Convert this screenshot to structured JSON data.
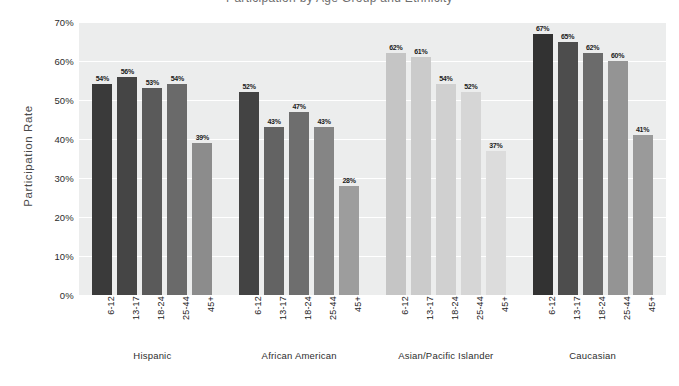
{
  "title_partial": "Participation by Age Group and Ethnicity",
  "axis": {
    "y_title": "Participation Rate",
    "y_ticks": [
      "70%",
      "60%",
      "50%",
      "40%",
      "30%",
      "20%",
      "10%",
      "0%"
    ]
  },
  "colors": {
    "plot_background": "#eceded",
    "gridline": "#ffffff",
    "text": "#232323"
  },
  "chart_data": {
    "type": "bar",
    "title": "Participation by Age Group and Ethnicity",
    "xlabel": "",
    "ylabel": "Participation Rate",
    "ylim": [
      0,
      70
    ],
    "ytick_labels": [
      "0%",
      "10%",
      "20%",
      "30%",
      "40%",
      "50%",
      "60%",
      "70%"
    ],
    "grid": true,
    "legend": "none",
    "categories": [
      "Hispanic",
      "African American",
      "Asian/Pacific Islander",
      "Caucasian"
    ],
    "age_groups": [
      "6-12",
      "13-17",
      "18-24",
      "25-44",
      "45+"
    ],
    "groups": [
      {
        "name": "Hispanic",
        "bars": [
          {
            "age": "6-12",
            "value": 54,
            "label": "54%",
            "color": "#3a3a3a"
          },
          {
            "age": "13-17",
            "value": 56,
            "label": "56%",
            "color": "#454545"
          },
          {
            "age": "18-24",
            "value": 53,
            "label": "53%",
            "color": "#5a5a5a"
          },
          {
            "age": "25-44",
            "value": 54,
            "label": "54%",
            "color": "#6a6a6a"
          },
          {
            "age": "45+",
            "value": 39,
            "label": "39%",
            "color": "#8c8c8c"
          }
        ]
      },
      {
        "name": "African American",
        "bars": [
          {
            "age": "6-12",
            "value": 52,
            "label": "52%",
            "color": "#434343"
          },
          {
            "age": "13-17",
            "value": 43,
            "label": "43%",
            "color": "#636363"
          },
          {
            "age": "18-24",
            "value": 47,
            "label": "47%",
            "color": "#6e6e6e"
          },
          {
            "age": "25-44",
            "value": 43,
            "label": "43%",
            "color": "#858585"
          },
          {
            "age": "45+",
            "value": 28,
            "label": "28%",
            "color": "#9d9d9d"
          }
        ]
      },
      {
        "name": "Asian/Pacific Islander",
        "bars": [
          {
            "age": "6-12",
            "value": 62,
            "label": "62%",
            "color": "#c5c5c5"
          },
          {
            "age": "13-17",
            "value": 61,
            "label": "61%",
            "color": "#cbcbcb"
          },
          {
            "age": "18-24",
            "value": 54,
            "label": "54%",
            "color": "#d0d0d0"
          },
          {
            "age": "25-44",
            "value": 52,
            "label": "52%",
            "color": "#d6d6d6"
          },
          {
            "age": "45+",
            "value": 37,
            "label": "37%",
            "color": "#dcdcdc"
          }
        ]
      },
      {
        "name": "Caucasian",
        "bars": [
          {
            "age": "6-12",
            "value": 67,
            "label": "67%",
            "color": "#323232"
          },
          {
            "age": "13-17",
            "value": 65,
            "label": "65%",
            "color": "#4d4d4d"
          },
          {
            "age": "18-24",
            "value": 62,
            "label": "62%",
            "color": "#6b6b6b"
          },
          {
            "age": "25-44",
            "value": 60,
            "label": "60%",
            "color": "#949494"
          },
          {
            "age": "45+",
            "value": 41,
            "label": "41%",
            "color": "#9a9a9a"
          }
        ]
      }
    ]
  }
}
